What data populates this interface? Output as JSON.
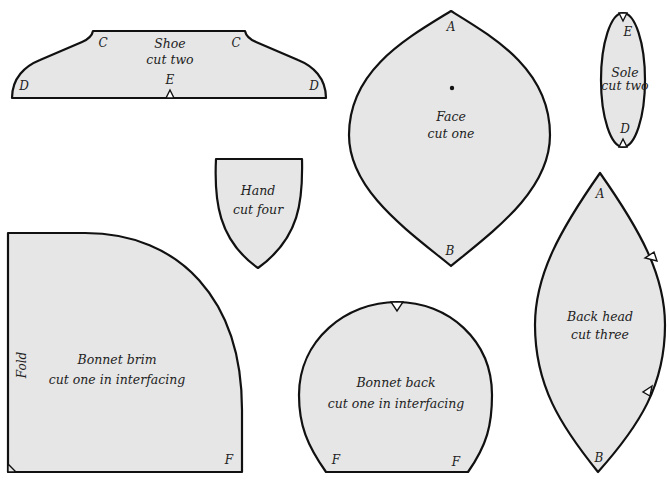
{
  "figure": {
    "fill_color": "#e6e6e6",
    "outline_color": "#111111"
  },
  "pieces": {
    "shoe": {
      "name": "Shoe",
      "instruction": "cut two",
      "points": {
        "c_left": "C",
        "c_right": "C",
        "d_left": "D",
        "d_right": "D",
        "e": "E"
      }
    },
    "face": {
      "name": "Face",
      "instruction": "cut one",
      "points": {
        "a": "A",
        "b": "B"
      }
    },
    "sole": {
      "name": "Sole",
      "instruction": "cut two",
      "points": {
        "e": "E",
        "d": "D"
      }
    },
    "hand": {
      "name": "Hand",
      "instruction": "cut four"
    },
    "bonnet_brim": {
      "name": "Bonnet brim",
      "instruction": "cut one in interfacing",
      "fold_label": "Fold",
      "points": {
        "f": "F"
      }
    },
    "bonnet_back": {
      "name": "Bonnet back",
      "instruction": "cut one in interfacing",
      "points": {
        "f_left": "F",
        "f_right": "F"
      }
    },
    "back_head": {
      "name": "Back head",
      "instruction": "cut three",
      "points": {
        "a": "A",
        "b": "B"
      }
    }
  }
}
